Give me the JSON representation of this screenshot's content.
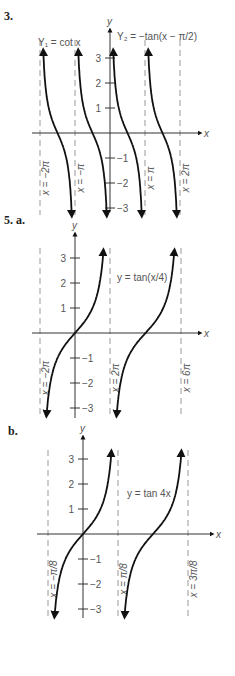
{
  "problems": [
    {
      "number": "3.",
      "sub": "",
      "x": 4,
      "y": 20
    },
    {
      "number": "5.",
      "sub": "a.",
      "x": 4,
      "y": 224
    },
    {
      "number": "",
      "sub": "b.",
      "x": 8,
      "y": 435
    }
  ],
  "graphs": [
    {
      "id": "graph-3",
      "origin": {
        "x": 110,
        "y": 133
      },
      "unit_y": 25,
      "axis_x": {
        "from": 32,
        "to": 200,
        "label": "x"
      },
      "axis_y": {
        "from": 212,
        "to": 30,
        "label": "y"
      },
      "ticks": [
        {
          "v": 3,
          "label": "3"
        },
        {
          "v": 2,
          "label": "2"
        },
        {
          "v": 1,
          "label": "1"
        },
        {
          "v": -1,
          "label": "−1"
        },
        {
          "v": -2,
          "label": "−2"
        },
        {
          "v": -3,
          "label": "−3"
        }
      ],
      "asymptotes": [
        {
          "x": 40,
          "label": "x = −2π"
        },
        {
          "x": 75,
          "label": "x = −π"
        },
        {
          "x": 145,
          "label": "x = π"
        },
        {
          "x": 180,
          "label": "x = 2π"
        }
      ],
      "asym_range": [
        40,
        215
      ],
      "curve_type": "cot",
      "branches": [
        [
          40,
          75
        ],
        [
          75,
          110
        ],
        [
          110,
          145
        ],
        [
          145,
          180
        ]
      ],
      "labels": [
        {
          "text": "Y₁ = cot x",
          "x": 38,
          "y": 46
        },
        {
          "text": "Y₂ = −tan(x − π/2)",
          "x": 117,
          "y": 40
        }
      ]
    },
    {
      "id": "graph-5a",
      "origin": {
        "x": 75,
        "y": 333
      },
      "unit_y": 25,
      "axis_x": {
        "from": 32,
        "to": 200,
        "label": "x"
      },
      "axis_y": {
        "from": 418,
        "to": 234,
        "label": "y"
      },
      "ticks": [
        {
          "v": 3,
          "label": "3"
        },
        {
          "v": 2,
          "label": "2"
        },
        {
          "v": 1,
          "label": "1"
        },
        {
          "v": -1,
          "label": "−1"
        },
        {
          "v": -2,
          "label": "−2"
        },
        {
          "v": -3,
          "label": "−3"
        }
      ],
      "asymptotes": [
        {
          "x": 40,
          "label": "x = −2π"
        },
        {
          "x": 110,
          "label": "x = 2π"
        },
        {
          "x": 181,
          "label": "x = 6π"
        }
      ],
      "asym_range": [
        248,
        418
      ],
      "curve_type": "tan",
      "branches": [
        [
          40,
          110
        ],
        [
          110,
          181
        ]
      ],
      "labels": [
        {
          "text": "y = tan(x/4)",
          "x": 117,
          "y": 281
        }
      ]
    },
    {
      "id": "graph-5b",
      "origin": {
        "x": 83,
        "y": 534
      },
      "unit_y": 25,
      "axis_x": {
        "from": 37,
        "to": 212,
        "label": "x"
      },
      "axis_y": {
        "from": 618,
        "to": 437,
        "label": "y"
      },
      "ticks": [
        {
          "v": 3,
          "label": "3"
        },
        {
          "v": 2,
          "label": "2"
        },
        {
          "v": 1,
          "label": "1"
        },
        {
          "v": -1,
          "label": "−1"
        },
        {
          "v": -2,
          "label": "−2"
        },
        {
          "v": -3,
          "label": "−3"
        }
      ],
      "asymptotes": [
        {
          "x": 48,
          "label": "x = −π/8"
        },
        {
          "x": 118,
          "label": "x = π/8"
        },
        {
          "x": 188,
          "label": "x = 3π/8"
        }
      ],
      "asym_range": [
        450,
        618
      ],
      "curve_type": "tan",
      "branches": [
        [
          48,
          118
        ],
        [
          118,
          188
        ]
      ],
      "labels": [
        {
          "text": "y = tan 4x",
          "x": 127,
          "y": 497
        }
      ]
    }
  ]
}
